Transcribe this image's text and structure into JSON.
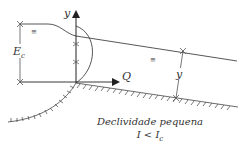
{
  "diagram": {
    "axis_y_label": "y",
    "axis_q_label": "Q",
    "energy_label_main": "E",
    "energy_label_sub": "c",
    "depth_label": "y",
    "caption_line1": "Declividade pequena",
    "caption_line2_main": "I < I",
    "caption_line2_sub": "c",
    "water_surface_symbol": "≡",
    "colors": {
      "line": "#333333",
      "background": "#ffffff"
    }
  }
}
